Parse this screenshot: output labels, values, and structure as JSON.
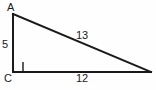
{
  "diagram": {
    "type": "right-triangle",
    "canvas": {
      "width": 156,
      "height": 90,
      "background": "#fefefe"
    },
    "stroke_color": "#1a1a1a",
    "text_color": "#1a1a1a",
    "vertices": [
      {
        "name": "A",
        "label": "A",
        "x": 13,
        "y": 14
      },
      {
        "name": "C",
        "label": "C",
        "x": 13,
        "y": 72
      },
      {
        "name": "B",
        "label": "",
        "x": 151,
        "y": 72
      }
    ],
    "right_angle": {
      "at_vertex": "C",
      "marker": "square",
      "size": 10
    },
    "sides": [
      {
        "name": "leg-vertical",
        "from": "A",
        "to": "C",
        "length_label": "5"
      },
      {
        "name": "hypotenuse",
        "from": "A",
        "to": "B",
        "length_label": "13"
      },
      {
        "name": "leg-horizontal",
        "from": "C",
        "to": "B",
        "length_label": "12"
      }
    ],
    "labels": {
      "vertex_a": "A",
      "vertex_c": "C",
      "side_ac": "5",
      "side_ab": "13",
      "side_cb": "12"
    }
  }
}
